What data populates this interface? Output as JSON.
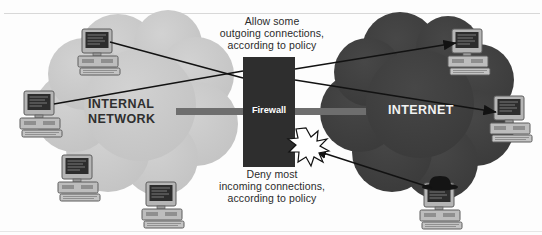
{
  "diagram": {
    "captions": {
      "allow": "Allow some\noutgoing connections,\naccording to policy",
      "deny": "Deny most\nincoming connections,\naccording to policy"
    },
    "zones": [
      {
        "id": "internal",
        "label": "INTERNAL\nNETWORK",
        "fill": "#c9c9c9",
        "text_color": "#2f2f2f"
      },
      {
        "id": "internet",
        "label": "INTERNET",
        "fill": "#3f3f3f",
        "text_color": "#f2f2f2"
      }
    ],
    "firewall": {
      "label": "Firewall",
      "fill": "#2e2e2e",
      "text_color": "#ffffff"
    },
    "link_bar": {
      "color": "#6e6e6e"
    },
    "blocked_marker": {
      "name": "starburst",
      "fill": "#ffffff",
      "stroke": "#111111"
    },
    "hosts": [
      {
        "id": "internal-top",
        "zone": "internal",
        "hat": false
      },
      {
        "id": "internal-left",
        "zone": "internal",
        "hat": false
      },
      {
        "id": "internal-bottom-left",
        "zone": "internal",
        "hat": false
      },
      {
        "id": "internal-bottom-right",
        "zone": "internal",
        "hat": false
      },
      {
        "id": "internet-top",
        "zone": "internet",
        "hat": false
      },
      {
        "id": "internet-right",
        "zone": "internet",
        "hat": false
      },
      {
        "id": "internet-attacker",
        "zone": "internet",
        "hat": true
      }
    ],
    "connections": [
      {
        "id": "outgoing-a",
        "from": "internal-top",
        "to": "internet-right",
        "allowed": true
      },
      {
        "id": "outgoing-b",
        "from": "internal-left",
        "to": "internet-top",
        "allowed": true
      },
      {
        "id": "incoming-blocked",
        "from": "internet-attacker",
        "to": "firewall",
        "allowed": false
      }
    ],
    "colors": {
      "internal_cloud": "#c9c9c9",
      "internet_cloud": "#3f3f3f",
      "firewall": "#2e2e2e",
      "line": "#121212",
      "page": "#fdfdfd"
    }
  }
}
